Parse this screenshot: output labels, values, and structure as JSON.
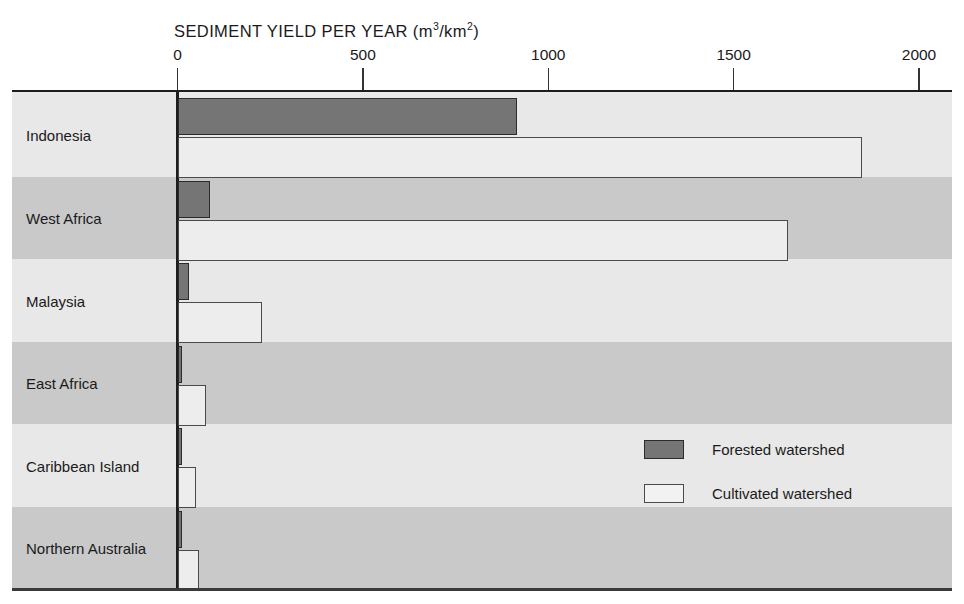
{
  "chart_data": {
    "type": "bar",
    "orientation": "horizontal",
    "title": "SEDIMENT YIELD PER YEAR (m3/km2)",
    "title_main": "SEDIMENT YIELD PER YEAR (m",
    "title_sup1": "3",
    "title_mid": "/km",
    "title_sup2": "2",
    "title_end": ")",
    "xlabel": "",
    "ylabel": "",
    "xlim": [
      0,
      2000
    ],
    "xticks": [
      0,
      500,
      1000,
      1500,
      2000
    ],
    "xtick_labels": [
      "0",
      "500",
      "1000",
      "1500",
      "2000"
    ],
    "grid": false,
    "legend_position": "center-right",
    "categories": [
      "Indonesia",
      "West Africa",
      "Malaysia",
      "East Africa",
      "Caribbean Island",
      "Northern Australia"
    ],
    "series": [
      {
        "name": "Forested watershed",
        "color": "#757575",
        "values": [
          915,
          89,
          32,
          12,
          10,
          11
        ]
      },
      {
        "name": "Cultivated watershed",
        "color": "#ededed",
        "values": [
          1846,
          1646,
          227,
          76,
          51,
          57
        ]
      }
    ]
  },
  "legend": {
    "items": [
      {
        "label": "Forested watershed",
        "style": "forested"
      },
      {
        "label": "Cultivated watershed",
        "style": "cultivated"
      }
    ]
  }
}
